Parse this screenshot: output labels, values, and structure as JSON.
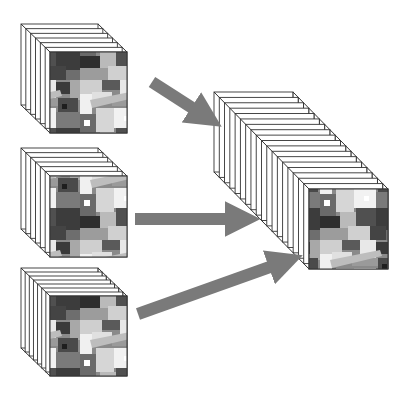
{
  "diagram": {
    "title": "",
    "colors": {
      "background": "#ffffff",
      "edge": "#333333",
      "arrow": "#7a7a7a",
      "face_dark": "#3a3a3a",
      "face_mid": "#8a8a8a",
      "face_light": "#d8d8d8"
    },
    "input_cubes": [
      {
        "id": "cube-1",
        "front": [
          50,
          52,
          127,
          133
        ],
        "offset": [
          -29,
          -28
        ],
        "slices": 6,
        "grid": false
      },
      {
        "id": "cube-2",
        "front": [
          50,
          176,
          127,
          257
        ],
        "offset": [
          -29,
          -28
        ],
        "slices": 6,
        "grid": false
      },
      {
        "id": "cube-3",
        "front": [
          50,
          296,
          127,
          376
        ],
        "offset": [
          -29,
          -28
        ],
        "slices": 7,
        "grid": true
      }
    ],
    "output_cube": {
      "id": "fused-cube",
      "front": [
        309,
        189,
        388,
        269
      ],
      "offset": [
        -95,
        -97
      ],
      "slices": 18,
      "grid": true
    },
    "arrows": [
      {
        "id": "arrow-top",
        "from": [
          152,
          82
        ],
        "to": [
          208,
          118
        ]
      },
      {
        "id": "arrow-middle",
        "from": [
          135,
          219
        ],
        "to": [
          248,
          219
        ]
      },
      {
        "id": "arrow-bottom",
        "from": [
          138,
          314
        ],
        "to": [
          295,
          258
        ]
      }
    ]
  }
}
